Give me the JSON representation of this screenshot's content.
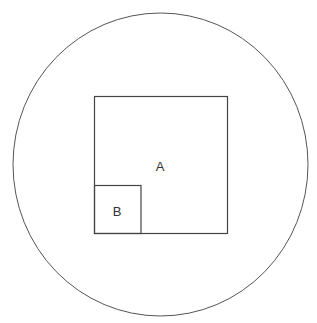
{
  "diagram": {
    "shapes": [
      {
        "type": "circle",
        "name": "outer-circle"
      },
      {
        "type": "square",
        "name": "A",
        "label": "A"
      },
      {
        "type": "square",
        "name": "B",
        "label": "B"
      }
    ],
    "labels": {
      "a": "A",
      "b": "B"
    },
    "colors": {
      "stroke": "#444444",
      "background": "#ffffff"
    }
  }
}
